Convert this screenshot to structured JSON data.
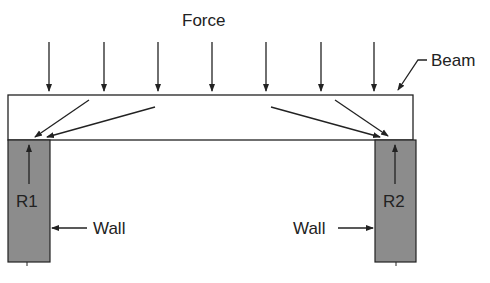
{
  "diagram": {
    "type": "beam-load-diagram",
    "labels": {
      "force": "Force",
      "beam": "Beam",
      "reaction_left": "R1",
      "reaction_right": "R2",
      "wall_left": "Wall",
      "wall_right": "Wall"
    },
    "force_arrow_count": 7,
    "colors": {
      "line": "#222222",
      "wall_fill": "#8c8c8c",
      "background": "#ffffff"
    }
  }
}
